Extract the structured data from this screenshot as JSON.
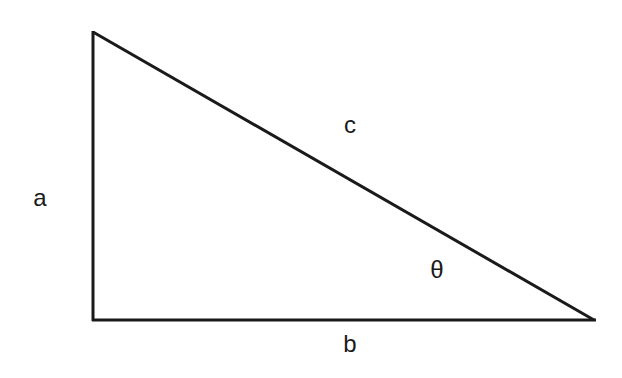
{
  "diagram": {
    "type": "right-triangle",
    "stroke_color": "#1a1a1a",
    "background_color": "#ffffff",
    "vertices": {
      "top": [
        93,
        32
      ],
      "right_angle": [
        93,
        320
      ],
      "right": [
        594,
        320
      ]
    },
    "labels": {
      "a": "a",
      "b": "b",
      "c": "c",
      "theta": "θ"
    }
  }
}
